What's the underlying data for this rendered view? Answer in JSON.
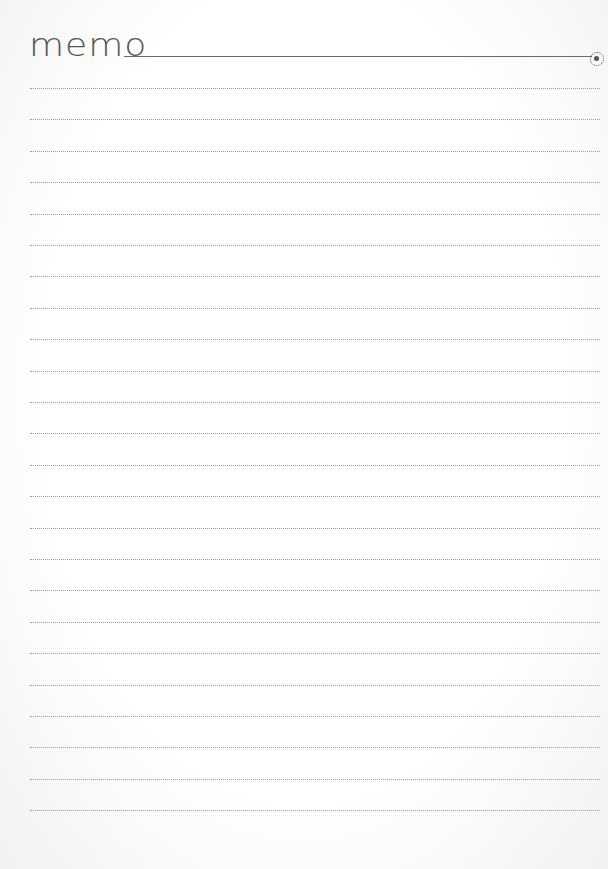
{
  "header": {
    "title": "memo",
    "binder_ring_icon": "ring-hole-icon"
  },
  "ruled_lines": {
    "count": 24,
    "first_y": 88,
    "spacing": 31.4,
    "style": "dotted",
    "color": "#9a9a9a"
  },
  "colors": {
    "title": "#555555",
    "rule": "#6a6a6a",
    "paper": "#ffffff"
  },
  "content": []
}
